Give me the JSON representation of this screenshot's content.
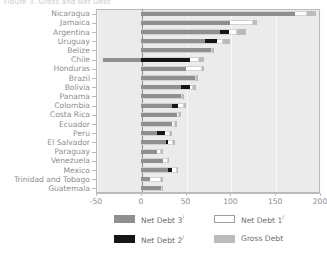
{
  "title_fragment": "Figure 3.  Gross and Net Debt",
  "axis": {
    "x_ticks": [
      "-50",
      "0",
      "50",
      "100",
      "150",
      "200"
    ],
    "xlim": [
      -50,
      200
    ],
    "tick_step": 50
  },
  "legend": {
    "items": [
      {
        "key": "net3",
        "label": "Net Debt 3",
        "sup": "/",
        "color": "#8f8f8f"
      },
      {
        "key": "net1",
        "label": "Net Debt 1",
        "sup": "/",
        "color": "#ffffff"
      },
      {
        "key": "net2",
        "label": "Net Debt 2",
        "sup": "/",
        "color": "#151515"
      },
      {
        "key": "gross",
        "label": "Gross Debt",
        "sup": "",
        "color": "#bcbcbc"
      }
    ]
  },
  "colors": {
    "gross": "#bcbcbc",
    "net1": "#ffffff",
    "net2": "#151515",
    "net3": "#8f8f8f",
    "plot_background": "#ebebeb",
    "grid": "#f7f7f7",
    "zero_line": "#8a8a8a",
    "text": "#8d8d8d"
  },
  "chart_data": {
    "type": "bar",
    "orientation": "horizontal",
    "title": "Gross and Net Debt",
    "xlabel": "",
    "ylabel": "",
    "xlim": [
      -50,
      200
    ],
    "grid": true,
    "legend_position": "bottom",
    "categories": [
      "Nicaragua",
      "Jamaica",
      "Argentina",
      "Uruguay",
      "Belize",
      "Chile",
      "Honduras",
      "Brazil",
      "Bolivia",
      "Panama",
      "Colombia",
      "Costa Rica",
      "Ecuador",
      "Peru",
      "El Salvador",
      "Paraguay",
      "Venezuela",
      "Mexico",
      "Trinidad and Tobago",
      "Guatemala"
    ],
    "series": [
      {
        "name": "Gross Debt",
        "key": "gross",
        "values": [
          195,
          130,
          117,
          100,
          82,
          70,
          70,
          64,
          62,
          48,
          50,
          45,
          40,
          35,
          38,
          25,
          32,
          42,
          25,
          25
        ]
      },
      {
        "name": "Net Debt 1",
        "key": "net1",
        "values": [
          185,
          125,
          107,
          92,
          80,
          65,
          68,
          62,
          58,
          46,
          48,
          43,
          38,
          33,
          36,
          23,
          30,
          40,
          23,
          24
        ]
      },
      {
        "name": "Net Debt 2",
        "key": "net2",
        "values": [
          null,
          null,
          98,
          85,
          null,
          55,
          null,
          null,
          55,
          null,
          42,
          null,
          null,
          27,
          30,
          null,
          null,
          35,
          null,
          null
        ]
      },
      {
        "name": "Net Debt 3",
        "key": "net3",
        "values": [
          172,
          100,
          88,
          72,
          78,
          -42,
          50,
          60,
          45,
          45,
          35,
          40,
          35,
          18,
          28,
          18,
          25,
          30,
          10,
          22
        ]
      }
    ]
  }
}
